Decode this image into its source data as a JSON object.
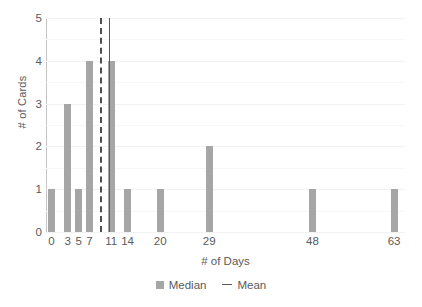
{
  "chart_data": {
    "type": "bar",
    "title": "",
    "xlabel": "# of Days",
    "ylabel": "# of Cards",
    "categories": [
      "0",
      "3",
      "5",
      "7",
      "11",
      "14",
      "20",
      "29",
      "48",
      "63"
    ],
    "x": [
      0,
      3,
      5,
      7,
      11,
      14,
      20,
      29,
      48,
      63
    ],
    "values": [
      1,
      3,
      1,
      4,
      4,
      1,
      1,
      2,
      1,
      1
    ],
    "xlim": [
      -1,
      65
    ],
    "ylim": [
      0,
      5
    ],
    "ytick_labels": [
      "0",
      "1",
      "2",
      "3",
      "4",
      "5"
    ],
    "ytick_values": [
      0,
      1,
      2,
      3,
      4,
      5
    ],
    "xtick_labels": [
      "0",
      "3",
      "5",
      "7",
      "11",
      "14",
      "20",
      "29",
      "48",
      "63"
    ],
    "grid": true,
    "grid_minor": true,
    "legend_position": "bottom-center",
    "legend": [
      {
        "label": "Median",
        "marker": "square",
        "color": "#a6a6a6"
      },
      {
        "label": "Mean",
        "marker": "dash",
        "color": "#595959"
      }
    ],
    "annotations": [
      {
        "name": "median-line",
        "type": "vline",
        "x": 9,
        "style": "dashed",
        "color": "#4d4d4d"
      },
      {
        "name": "mean-line",
        "type": "vline",
        "x": 10.6,
        "style": "solid",
        "color": "#595959"
      }
    ],
    "bar_color": "#a6a6a6",
    "axis_color": "#c4c4c4",
    "grid_color": "#f2f2f2",
    "text_color": "#5a5a5a"
  }
}
